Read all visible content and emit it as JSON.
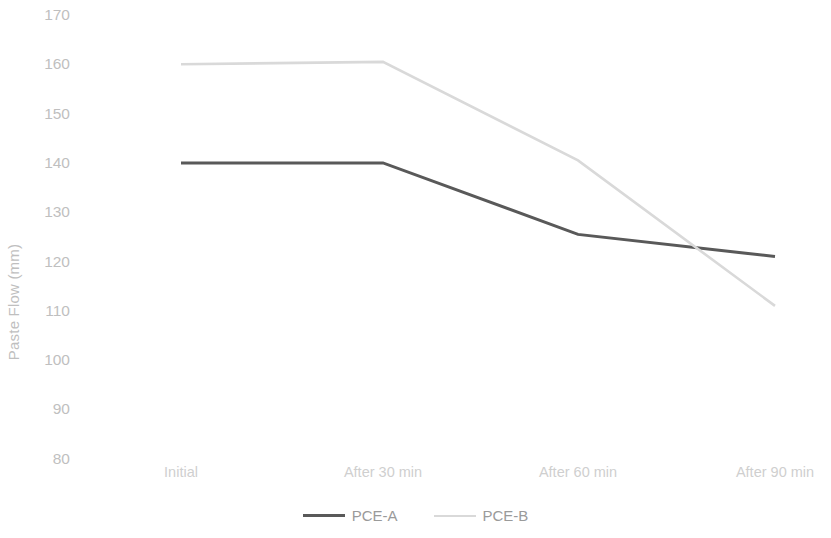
{
  "chart_data": {
    "type": "line",
    "title": "",
    "subtitle": "",
    "xlabel": "",
    "ylabel": "Paste Flow (mm)",
    "categories": [
      "Initial",
      "After 30 min",
      "After 60 min",
      "After 90 min"
    ],
    "series": [
      {
        "name": "PCE-A",
        "values": [
          140,
          140,
          125.5,
          121
        ],
        "color": "#595959",
        "line_width": 3,
        "line_style": "solid"
      },
      {
        "name": "PCE-B",
        "values": [
          160,
          160.5,
          140.5,
          111
        ],
        "color": "#d9d9d9",
        "line_width": 2.6,
        "line_style": "solid"
      }
    ],
    "ylim": [
      80,
      170
    ],
    "ytick_step": 10,
    "yticks": [
      170,
      160,
      150,
      140,
      130,
      120,
      110,
      100,
      90,
      80
    ],
    "grid": false,
    "axis_lines": false,
    "markers": false,
    "legend_position": "bottom-center",
    "background_color": "#ffffff",
    "tick_label_color": "#bfbfbf",
    "axis_title_color": "#bfbfbf"
  },
  "axis": {
    "y_title": "Paste Flow (mm)"
  },
  "legend": {
    "entries": [
      {
        "label": "PCE-A"
      },
      {
        "label": "PCE-B"
      }
    ]
  }
}
